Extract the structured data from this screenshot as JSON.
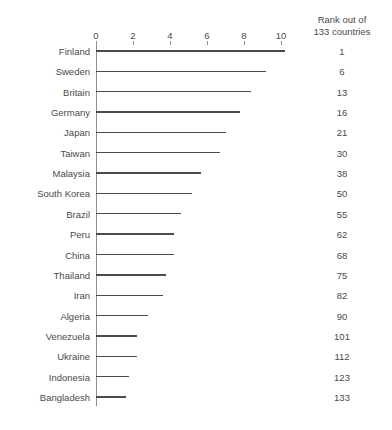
{
  "chart_data": {
    "type": "bar",
    "orientation": "horizontal",
    "title": "",
    "subtitle": "",
    "xlabel": "",
    "ylabel": "",
    "xlim": [
      0,
      10.8
    ],
    "xticks": [
      0,
      2,
      4,
      6,
      8,
      10
    ],
    "xtick_labels": [
      "0",
      "2",
      "4",
      "6",
      "8",
      "10"
    ],
    "grid": false,
    "legend": null,
    "categories": [
      "Finland",
      "Sweden",
      "Britain",
      "Germany",
      "Japan",
      "Taiwan",
      "Malaysia",
      "South Korea",
      "Brazil",
      "Peru",
      "China",
      "Thailand",
      "Iran",
      "Algeria",
      "Venezuela",
      "Ukraine",
      "Indonesia",
      "Bangladesh"
    ],
    "values": [
      10.2,
      9.2,
      8.4,
      7.8,
      7.0,
      6.7,
      5.7,
      5.2,
      4.6,
      4.2,
      4.2,
      3.8,
      3.6,
      2.8,
      2.2,
      2.2,
      1.8,
      1.6
    ],
    "annotation_column": {
      "header_line1": "Rank out of",
      "header_line2": "133 countries",
      "values": [
        "1",
        "6",
        "13",
        "16",
        "21",
        "30",
        "38",
        "50",
        "55",
        "62",
        "68",
        "75",
        "82",
        "90",
        "101",
        "112",
        "123",
        "133"
      ]
    },
    "colors": {
      "bar": "#4b4b4b",
      "axis": "#8f8f8f",
      "text": "#4a4a4a",
      "background": "#ffffff"
    }
  }
}
